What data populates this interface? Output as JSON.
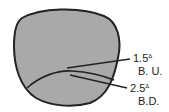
{
  "diagram": {
    "colors": {
      "lens_fill": "#a9a9a9",
      "outline": "#222222",
      "text": "#222222"
    },
    "labels": [
      {
        "value": "1.5",
        "unit": "Δ",
        "base": "B. U."
      },
      {
        "value": "2.5",
        "unit": "Δ",
        "base": "B.D."
      }
    ]
  }
}
